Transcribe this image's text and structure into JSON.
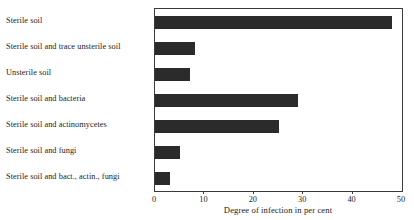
{
  "chart_data": {
    "type": "bar",
    "orientation": "horizontal",
    "title": "",
    "xlabel": "Degree of infection in per cent",
    "ylabel": "",
    "xlim": [
      0,
      50
    ],
    "xticks": [
      0,
      10,
      20,
      30,
      40,
      50
    ],
    "xtick_labels": [
      "0",
      "10",
      "20",
      "30",
      "40",
      "50"
    ],
    "grid": false,
    "legend": false,
    "bar_color": "#2b2b2b",
    "frame_color": "#3a3a3a",
    "categories": [
      "Sterile soil",
      "Sterile soil and trace unsterile soil",
      "Unsterile soil",
      "Sterile soil and bacteria",
      "Sterile soil and actinomycetes",
      "Sterile soil and fungi",
      "Sterile soil and bact., actin., fungi"
    ],
    "values": [
      48,
      8,
      7,
      29,
      25,
      5,
      3
    ]
  }
}
